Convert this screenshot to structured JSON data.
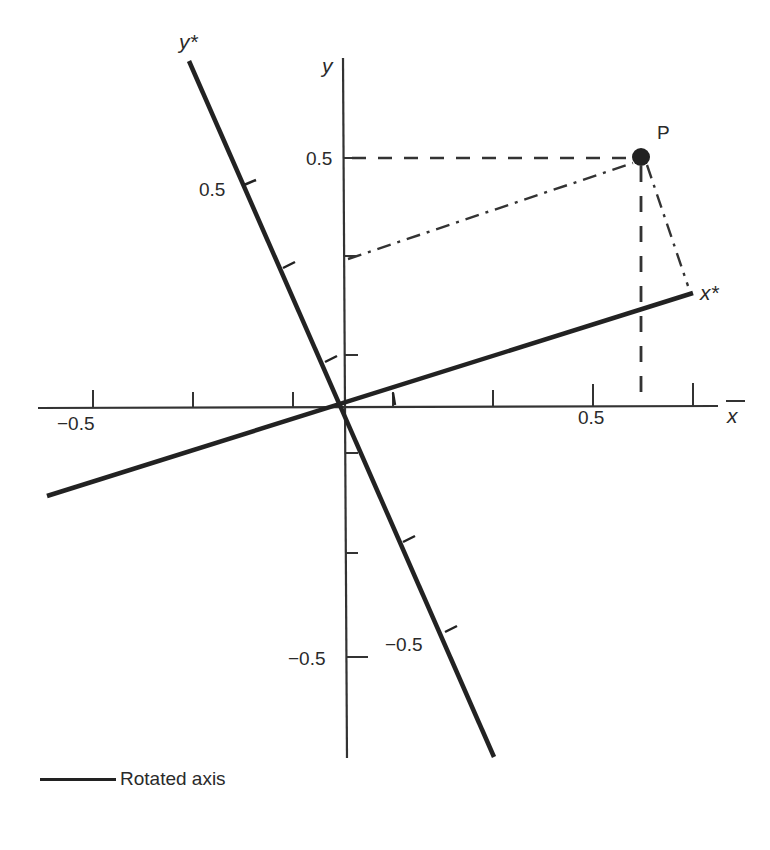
{
  "diagram": {
    "type": "coordinate-rotation",
    "origin_px": [
      343,
      408
    ],
    "scale_px_per_unit": 500,
    "axes": {
      "x": {
        "label": "x",
        "tick_values": [
          -0.5,
          -0.3,
          -0.1,
          0.1,
          0.3,
          0.5,
          0.7
        ],
        "labeled_ticks": {
          "-0.5": "−0.5",
          "0.5": "0.5"
        }
      },
      "y": {
        "label": "y",
        "tick_values": [
          0.5,
          0.3,
          0.1,
          -0.1,
          -0.3,
          -0.5
        ],
        "labeled_ticks": {
          "0.5": "0.5",
          "-0.5": "−0.5"
        }
      },
      "x_star": {
        "label": "x*",
        "angle_deg": 18.2
      },
      "y_star": {
        "label": "y*",
        "tick_labels": {
          "pos": "0.5",
          "neg": "−0.5"
        }
      }
    },
    "point": {
      "label": "P",
      "x": 0.6,
      "y": 0.5
    },
    "labels": {
      "x": "x",
      "y": "y",
      "x_star": "x*",
      "y_star": "y*",
      "P": "P",
      "x_neg": "−0.5",
      "x_pos": "0.5",
      "y_pos": "0.5",
      "y_neg": "−0.5",
      "ystar_pos": "0.5",
      "ystar_neg": "−0.5"
    }
  },
  "legend": {
    "items": [
      {
        "label": "Rotated axis",
        "style": "thick-solid"
      }
    ]
  }
}
